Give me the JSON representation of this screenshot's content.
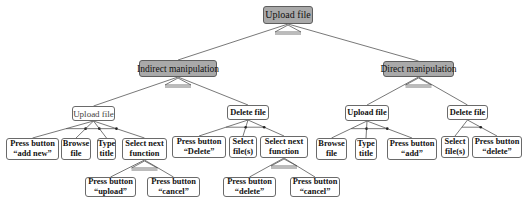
{
  "diagram": {
    "type": "hierarchical task tree",
    "nodes": [
      {
        "id": "root",
        "label": "Upload file",
        "x": 263,
        "y": 6,
        "w": 50,
        "h": 18,
        "style": "grey root"
      },
      {
        "id": "indirect",
        "label": "Indirect manipulation",
        "x": 139,
        "y": 60,
        "w": 78,
        "h": 17,
        "style": "grey"
      },
      {
        "id": "direct",
        "label": "Direct manipulation",
        "x": 383,
        "y": 61,
        "w": 71,
        "h": 16,
        "style": "grey"
      },
      {
        "id": "ind_upload",
        "label": "Upload file",
        "x": 72,
        "y": 106,
        "w": 43,
        "h": 15,
        "style": "plain"
      },
      {
        "id": "ind_delete",
        "label": "Delete file",
        "x": 227,
        "y": 105,
        "w": 42,
        "h": 15,
        "style": "bold"
      },
      {
        "id": "dir_upload",
        "label": "Upload file",
        "x": 345,
        "y": 105,
        "w": 44,
        "h": 16,
        "style": "bold"
      },
      {
        "id": "dir_delete",
        "label": "Delete file",
        "x": 447,
        "y": 105,
        "w": 41,
        "h": 15,
        "style": "bold"
      },
      {
        "id": "add_new",
        "label": "Press button\n“add new”",
        "x": 6,
        "y": 138,
        "w": 53,
        "h": 22,
        "style": "bold"
      },
      {
        "id": "browse1",
        "label": "Browse\nfile",
        "x": 61,
        "y": 138,
        "w": 30,
        "h": 22,
        "style": "bold"
      },
      {
        "id": "type1",
        "label": "Type\ntitle",
        "x": 97,
        "y": 138,
        "w": 19,
        "h": 22,
        "style": "bold"
      },
      {
        "id": "selnext1",
        "label": "Select next\nfunction",
        "x": 122,
        "y": 138,
        "w": 45,
        "h": 22,
        "style": "bold"
      },
      {
        "id": "press_delete_cap",
        "label": "Press button\n“Delete”",
        "x": 172,
        "y": 136,
        "w": 54,
        "h": 22,
        "style": "bold"
      },
      {
        "id": "select_files1",
        "label": "Select\nfile(s)",
        "x": 229,
        "y": 136,
        "w": 28,
        "h": 22,
        "style": "bold"
      },
      {
        "id": "selnext2",
        "label": "Select next\nfunction",
        "x": 260,
        "y": 136,
        "w": 48,
        "h": 22,
        "style": "bold"
      },
      {
        "id": "press_upload",
        "label": "Press button\n“upload”",
        "x": 85,
        "y": 177,
        "w": 51,
        "h": 20,
        "style": "bold"
      },
      {
        "id": "press_cancel1",
        "label": "Press button\n“cancel”",
        "x": 147,
        "y": 177,
        "w": 53,
        "h": 20,
        "style": "bold"
      },
      {
        "id": "press_delete",
        "label": "Press button\n“delete”",
        "x": 223,
        "y": 177,
        "w": 53,
        "h": 20,
        "style": "bold"
      },
      {
        "id": "press_cancel2",
        "label": "Press button\n“cancel”",
        "x": 290,
        "y": 177,
        "w": 50,
        "h": 20,
        "style": "bold"
      },
      {
        "id": "browse2",
        "label": "Browse\nfile",
        "x": 316,
        "y": 138,
        "w": 31,
        "h": 22,
        "style": "bold"
      },
      {
        "id": "type2",
        "label": "Type\ntitle",
        "x": 355,
        "y": 138,
        "w": 22,
        "h": 22,
        "style": "bold"
      },
      {
        "id": "press_add",
        "label": "Press button\n“add”",
        "x": 387,
        "y": 138,
        "w": 50,
        "h": 22,
        "style": "bold"
      },
      {
        "id": "select_files2",
        "label": "Select\nfile(s)",
        "x": 441,
        "y": 136,
        "w": 28,
        "h": 22,
        "style": "bold"
      },
      {
        "id": "press_delete_lc",
        "label": "Press button\n“delete”",
        "x": 472,
        "y": 136,
        "w": 50,
        "h": 22,
        "style": "bold"
      }
    ],
    "edges": [
      [
        "root",
        "indirect"
      ],
      [
        "root",
        "direct"
      ],
      [
        "indirect",
        "ind_upload"
      ],
      [
        "indirect",
        "ind_delete"
      ],
      [
        "direct",
        "dir_upload"
      ],
      [
        "direct",
        "dir_delete"
      ],
      [
        "ind_upload",
        "add_new"
      ],
      [
        "ind_upload",
        "browse1"
      ],
      [
        "ind_upload",
        "type1"
      ],
      [
        "ind_upload",
        "selnext1"
      ],
      [
        "ind_delete",
        "press_delete_cap"
      ],
      [
        "ind_delete",
        "select_files1"
      ],
      [
        "ind_delete",
        "selnext2"
      ],
      [
        "selnext1",
        "press_upload"
      ],
      [
        "selnext1",
        "press_cancel1"
      ],
      [
        "selnext2",
        "press_delete"
      ],
      [
        "selnext2",
        "press_cancel2"
      ],
      [
        "dir_upload",
        "browse2"
      ],
      [
        "dir_upload",
        "type2"
      ],
      [
        "dir_upload",
        "press_add"
      ],
      [
        "dir_delete",
        "select_files2"
      ],
      [
        "dir_delete",
        "press_delete_lc"
      ]
    ],
    "or_decompositions": [
      "root",
      "indirect",
      "direct",
      "selnext1",
      "selnext2"
    ],
    "sequence_decompositions": [
      "ind_upload",
      "ind_delete",
      "dir_upload",
      "dir_delete"
    ]
  }
}
